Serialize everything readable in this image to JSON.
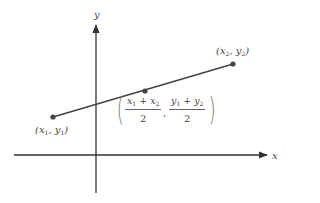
{
  "diagram": {
    "axes": {
      "x_label": "x",
      "y_label": "y"
    },
    "points": [
      {
        "id": "p1",
        "label_var_x": "x",
        "label_sub_x": "1",
        "label_var_y": "y",
        "label_sub_y": "1",
        "px": 53,
        "py": 117
      },
      {
        "id": "mid",
        "px": 145,
        "py": 91
      },
      {
        "id": "p2",
        "label_var_x": "x",
        "label_sub_x": "2",
        "label_var_y": "y",
        "label_sub_y": "2",
        "px": 233,
        "py": 64
      }
    ],
    "midpoint_formula": {
      "x_num_a": "x",
      "x_num_a_sub": "1",
      "plus": "+",
      "x_num_b": "x",
      "x_num_b_sub": "2",
      "x_den": "2",
      "y_num_a": "y",
      "y_num_a_sub": "1",
      "y_num_b": "y",
      "y_num_b_sub": "2",
      "y_den": "2",
      "separator": ",",
      "open_paren": "(",
      "close_paren": ")"
    },
    "colors": {
      "axis": "#333333",
      "segment": "#444444",
      "point": "#444444",
      "text": "#444444"
    }
  }
}
